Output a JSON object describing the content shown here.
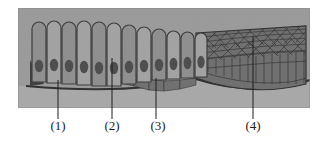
{
  "figure": {
    "kind": "histology-diagram",
    "title_text": "",
    "panel": {
      "x": 18,
      "y": 8,
      "width": 292,
      "height": 100,
      "background_color": "#9a9a9a"
    },
    "colors": {
      "background": "#9a9a9a",
      "panel_bg": "#9a9a9a",
      "cell_fill": "#8e8e8e",
      "cell_fill_light": "#a2a2a2",
      "cell_outline": "#3a3a3a",
      "nucleus_fill": "#4c4c4c",
      "basal_layer_fill": "#6f6f6f",
      "stratified_fill": "#6a6a6a",
      "connective_fill": "#a6a6a6",
      "leader_line": "#1e1e1e",
      "label_text": "#1c1c1c"
    },
    "regions": [
      {
        "name": "simple-columnar-epithelium",
        "description": "Tall column-shaped cells with rounded apical ends and oval basal nuclei",
        "cell_count": 12,
        "x_start": 30,
        "x_end": 196
      },
      {
        "name": "stratified-squamous-epithelium",
        "description": "Multilayered flattened cells forming a mesh on the right side",
        "x_start": 196,
        "x_end": 306
      },
      {
        "name": "basement-membrane",
        "description": "Dark boundary line beneath the epithelium"
      },
      {
        "name": "connective-tissue",
        "description": "Light band below the basement membrane"
      }
    ],
    "columnar_cells": [
      {
        "x": 32,
        "w": 14,
        "top": 22,
        "bottom": 82,
        "nucleus_y": 66
      },
      {
        "x": 47,
        "w": 14,
        "top": 21,
        "bottom": 83,
        "nucleus_y": 65
      },
      {
        "x": 62,
        "w": 14,
        "top": 22,
        "bottom": 84,
        "nucleus_y": 66
      },
      {
        "x": 77,
        "w": 14,
        "top": 21,
        "bottom": 85,
        "nucleus_y": 67
      },
      {
        "x": 92,
        "w": 14,
        "top": 22,
        "bottom": 86,
        "nucleus_y": 68
      },
      {
        "x": 107,
        "w": 14,
        "top": 23,
        "bottom": 86,
        "nucleus_y": 68
      },
      {
        "x": 122,
        "w": 14,
        "top": 25,
        "bottom": 84,
        "nucleus_y": 67
      },
      {
        "x": 137,
        "w": 14,
        "top": 27,
        "bottom": 82,
        "nucleus_y": 66
      },
      {
        "x": 152,
        "w": 14,
        "top": 29,
        "bottom": 80,
        "nucleus_y": 65
      },
      {
        "x": 167,
        "w": 13,
        "top": 31,
        "bottom": 79,
        "nucleus_y": 64
      },
      {
        "x": 181,
        "w": 13,
        "top": 32,
        "bottom": 78,
        "nucleus_y": 63
      },
      {
        "x": 195,
        "w": 12,
        "top": 33,
        "bottom": 77,
        "nucleus_y": 62
      }
    ],
    "callouts": [
      {
        "id": "callout-1",
        "label": "(1)",
        "label_x": 58,
        "label_y": 130,
        "line_x": 58,
        "line_top": 80,
        "line_bottom": 119,
        "points_to": "basement-membrane"
      },
      {
        "id": "callout-2",
        "label": "(2)",
        "label_x": 112,
        "label_y": 130,
        "line_x": 112,
        "line_top": 58,
        "line_bottom": 119,
        "points_to": "simple-columnar-epithelium"
      },
      {
        "id": "callout-3",
        "label": "(3)",
        "label_x": 158,
        "label_y": 130,
        "line_x": 156,
        "line_top": 78,
        "line_bottom": 119,
        "points_to": "basal-cell-layer"
      },
      {
        "id": "callout-4",
        "label": "(4)",
        "label_x": 253,
        "label_y": 130,
        "line_x": 253,
        "line_top": 36,
        "line_bottom": 119,
        "points_to": "stratified-squamous-epithelium"
      }
    ]
  }
}
